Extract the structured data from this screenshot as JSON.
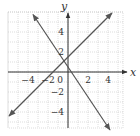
{
  "chart_data": {
    "type": "line",
    "title": "",
    "xlabel": "x",
    "ylabel": "y",
    "xlim": [
      -6,
      5.5
    ],
    "ylim": [
      -5.6,
      6
    ],
    "grid": true,
    "x_ticks": [
      -4,
      -2,
      0,
      2,
      4
    ],
    "y_ticks": [
      -4,
      -2,
      2,
      4
    ],
    "tick_labels": {
      "x": [
        "−4",
        "−2",
        "0",
        "2",
        "4"
      ],
      "y": [
        "4",
        "2",
        "−2",
        "−4"
      ]
    },
    "series": [
      {
        "name": "rising line",
        "equation": "y = x + 1.5",
        "slope": 1,
        "intercept": 1.5,
        "x": [
          -5.9,
          4.4
        ],
        "y": [
          -4.4,
          5.9
        ],
        "color": "#555555",
        "arrows": "both"
      },
      {
        "name": "falling line",
        "equation": "y = -1.5x + 0.5",
        "slope": -1.5,
        "intercept": 0.5,
        "x": [
          -3.5,
          4.2
        ],
        "y": [
          5.75,
          -5.8
        ],
        "color": "#555555",
        "arrows": "both"
      }
    ],
    "intersection": {
      "x": -0.4,
      "y": 1.1
    },
    "legend": null
  },
  "style": {
    "grid_color": "#c8c8c8",
    "axis_color": "#333333",
    "line_color": "#555555"
  }
}
